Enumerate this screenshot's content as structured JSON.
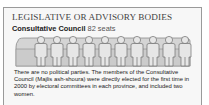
{
  "section": {
    "title": "LEGISLATIVE OR ADVISORY BODIES",
    "body_name": "Consultative Council",
    "seats": "82 seats",
    "figure_count": 10,
    "description": "There are no political parties. The members of the Consultative Council (Majlis ash-shoura) were directly elected for the first time in 2000 by electoral committees in each province, and included two women."
  },
  "colors": {
    "border": "#9a9a9a",
    "panel_bg": "#f7f7f7",
    "bench": "#d2d2d2",
    "figure_fill": "#e4e4e4",
    "figure_stroke": "#6e6e6e"
  }
}
